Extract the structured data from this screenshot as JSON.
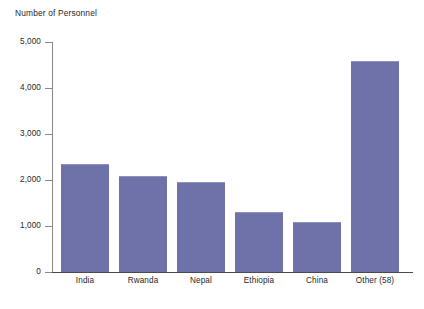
{
  "chart_data": {
    "type": "bar",
    "title": "",
    "ylabel": "Number of Personnel",
    "xlabel": "",
    "categories": [
      "India",
      "Rwanda",
      "Nepal",
      "Ethiopia",
      "China",
      "Other (58)"
    ],
    "values": [
      2350,
      2090,
      1960,
      1300,
      1090,
      4590
    ],
    "series": [
      {
        "name": "Number of Personnel",
        "values": [
          2350,
          2090,
          1960,
          1300,
          1090,
          4590
        ]
      }
    ],
    "ylim": [
      0,
      5000
    ],
    "ytick_values": [
      5000,
      4000,
      3000,
      2000,
      1000,
      0
    ],
    "ytick_labels": [
      "5,000",
      "4,000",
      "3,000",
      "2,000",
      "1,000",
      "0"
    ],
    "grid": false,
    "legend": false,
    "bar_color": "#6e72a8",
    "axis_color": "#8a8a8a",
    "background_color": "#ffffff"
  },
  "footnote": ""
}
